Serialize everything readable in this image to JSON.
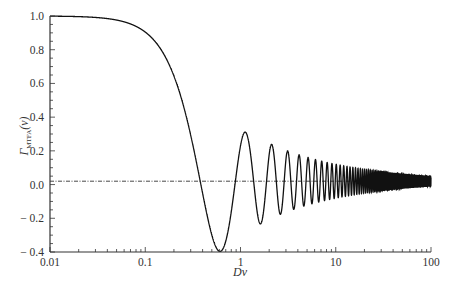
{
  "chart_data": {
    "type": "line",
    "title": "",
    "xlabel": "Dv",
    "ylabel": "Γ_MTFA(v)",
    "ylabel_main": "Γ",
    "ylabel_sub": "MTFA",
    "ylabel_arg": "(v)",
    "xscale": "log",
    "xlim": [
      0.01,
      100
    ],
    "ylim": [
      -0.4,
      1.0
    ],
    "xticks": [
      0.01,
      0.1,
      1,
      10,
      100
    ],
    "xtick_labels": [
      "0.01",
      "0.1",
      "1",
      "10",
      "100"
    ],
    "yticks": [
      1.0,
      0.8,
      0.6,
      0.4,
      0.2,
      0.0,
      -0.2,
      -0.4
    ],
    "ytick_labels": [
      "1.0",
      "0.8",
      "0.6",
      "0.4",
      "0.2",
      "0.0",
      "− 0.2",
      "− 0.4"
    ],
    "grid": false,
    "legend": null,
    "reference_line": {
      "y": 0.02,
      "style": "dash-dot"
    },
    "series": [
      {
        "name": "Γ_MTFA(v)",
        "model": "J0(2π·Dv)",
        "x": [
          0.01,
          0.05,
          0.1,
          0.2,
          0.3,
          0.38,
          0.5,
          0.6,
          0.7,
          0.88,
          1.0,
          1.12,
          1.4,
          1.62,
          1.9,
          2.12,
          2.6,
          3.12,
          5,
          10,
          20,
          50,
          100
        ],
        "values": [
          1.0,
          0.98,
          0.91,
          0.65,
          0.3,
          0.0,
          -0.3,
          -0.4,
          -0.34,
          0.0,
          0.22,
          0.3,
          0.0,
          -0.25,
          0.05,
          0.22,
          -0.2,
          0.18,
          0.14,
          0.1,
          0.07,
          0.045,
          0.032
        ]
      }
    ]
  }
}
